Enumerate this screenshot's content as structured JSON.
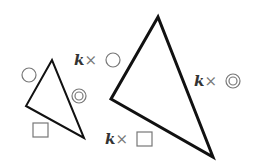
{
  "diagram": {
    "small_triangle": {
      "vertices": [
        [
          52,
          60
        ],
        [
          26,
          106
        ],
        [
          84,
          138
        ]
      ],
      "side_labels": {
        "left_top": "circle",
        "right": "double-circle",
        "bottom": "square"
      }
    },
    "large_triangle": {
      "vertices": [
        [
          158,
          17
        ],
        [
          111,
          99
        ],
        [
          213,
          157
        ]
      ],
      "side_labels": {
        "left_top": "k × circle",
        "right": "k × double-circle",
        "bottom": "k × square"
      }
    },
    "labels": {
      "k": "k",
      "times": "×"
    },
    "colors": {
      "stroke": "#111111",
      "symbol": "#777777",
      "text": "#333333"
    }
  }
}
